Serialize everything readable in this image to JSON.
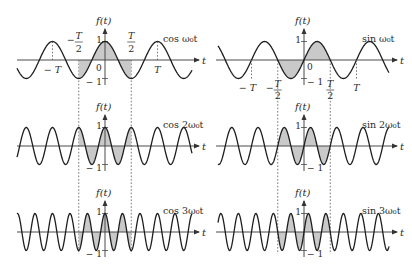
{
  "figure": {
    "colors": {
      "curve": "#1e1e1e",
      "axis": "#4a4a4a",
      "shade": "#c9c9c9",
      "dashed": "#555555"
    },
    "period_symbol": "T",
    "axis_y_label": "f(t)",
    "axis_x_label": "t",
    "tick_pos_one": "1",
    "tick_neg_one": "− 1",
    "origin_label": "0",
    "panels": [
      {
        "id": "cos1",
        "func": "cos",
        "harmonic": 1,
        "label": "cos ω₀t"
      },
      {
        "id": "sin1",
        "func": "sin",
        "harmonic": 1,
        "label": "sin ω₀t"
      },
      {
        "id": "cos2",
        "func": "cos",
        "harmonic": 2,
        "label": "cos 2ω₀t"
      },
      {
        "id": "sin2",
        "func": "sin",
        "harmonic": 2,
        "label": "sin 2ω₀t"
      },
      {
        "id": "cos3",
        "func": "cos",
        "harmonic": 3,
        "label": "cos 3ω₀t"
      },
      {
        "id": "sin3",
        "func": "sin",
        "harmonic": 3,
        "label": "sin 3ω₀t"
      }
    ],
    "time_marks": {
      "neg_T": "− T",
      "neg_half_T_num": "T",
      "neg_half_T_den": "2",
      "neg_half_T_sign": "−",
      "half_T_num": "T",
      "half_T_den": "2",
      "T": "T"
    },
    "shaded_interval_in_periods": [
      -0.5,
      0.5
    ],
    "amplitude": 1
  }
}
